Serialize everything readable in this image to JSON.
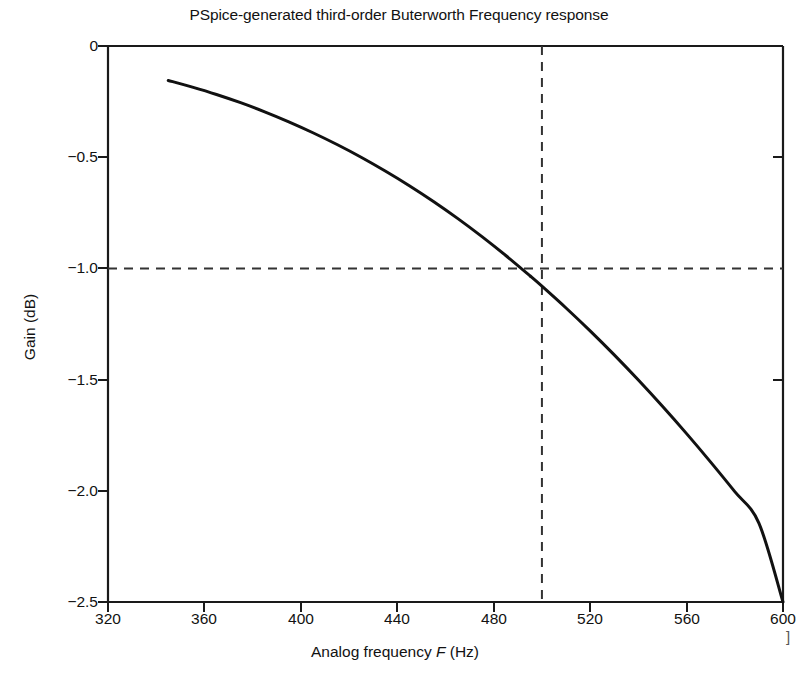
{
  "chart_data": {
    "type": "line",
    "title": "PSpice-generated third-order Buterworth Frequency response",
    "xlabel_parts": {
      "pre": "Analog frequency ",
      "italic": "F",
      "post": " (Hz)"
    },
    "xlabel": "Analog frequency F (Hz)",
    "ylabel": "Gain (dB)",
    "xlim": [
      320,
      600
    ],
    "ylim": [
      -2.5,
      0
    ],
    "xticks": [
      320,
      360,
      400,
      440,
      480,
      520,
      560,
      600
    ],
    "xtick_labels": [
      "320",
      "360",
      "400",
      "440",
      "480",
      "520",
      "560",
      "600"
    ],
    "yticks": [
      0,
      -0.5,
      -1.0,
      -1.5,
      -2.0,
      -2.5
    ],
    "ytick_labels": [
      "0",
      "−0.5",
      "−1.0",
      "−1.5",
      "−2.0",
      "−2.5"
    ],
    "grid": false,
    "legend": null,
    "line_color": "#111111",
    "line_width": 3.0,
    "series": [
      {
        "name": "Third-order Butterworth gain",
        "x": [
          345,
          355,
          365,
          375,
          385,
          395,
          405,
          415,
          425,
          435,
          445,
          455,
          465,
          475,
          485,
          495,
          500,
          510,
          520,
          530,
          540,
          550,
          560,
          570,
          580,
          590,
          600
        ],
        "values": [
          -0.155,
          -0.185,
          -0.218,
          -0.255,
          -0.296,
          -0.341,
          -0.39,
          -0.443,
          -0.5,
          -0.562,
          -0.628,
          -0.699,
          -0.775,
          -0.856,
          -0.942,
          -1.033,
          -1.08,
          -1.178,
          -1.281,
          -1.389,
          -1.502,
          -1.62,
          -1.743,
          -1.871,
          -2.004,
          -2.145,
          -2.5
        ]
      }
    ],
    "annotations": {
      "cutoff_marker": {
        "type": "crosshair-dashed",
        "x": 500,
        "y": -1.0,
        "x_label": "500",
        "y_label": "−1.0",
        "color": "#333333",
        "description": "dashed lines marking the 1 dB cutoff at 500 Hz"
      }
    },
    "edge_artifact": "]"
  }
}
